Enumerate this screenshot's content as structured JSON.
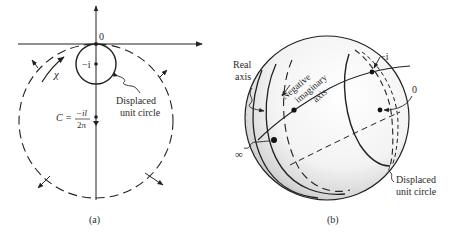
{
  "panel_a": {
    "caption": "(a)",
    "origin_label": "0",
    "center_point_label": "−i",
    "arc_label": "χ",
    "circle_label_line1": "Displaced",
    "circle_label_line2": "unit circle",
    "C_lhs": "C =",
    "C_numerator": "−il",
    "C_denominator": "2π"
  },
  "panel_b": {
    "caption": "(b)",
    "real_axis_line1": "Real",
    "real_axis_line2": "axis",
    "neg_imag_line1": "Negative",
    "neg_imag_line2": "imaginary",
    "neg_imag_line3": "axis",
    "minus_i_label": "−i",
    "zero_label": "0",
    "infinity_label": "∞",
    "circle_label_line1": "Displaced",
    "circle_label_line2": "unit circle"
  },
  "colors": {
    "ink": "#222222",
    "background": "#ffffff"
  }
}
